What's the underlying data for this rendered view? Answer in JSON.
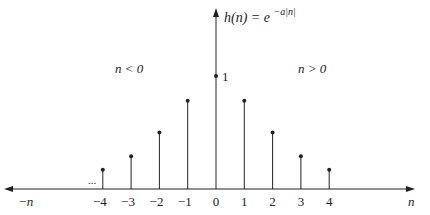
{
  "chart_data": {
    "type": "stem",
    "function_label": "h(n) = e",
    "exponent_label": "−a|n|",
    "xlabel": "n",
    "xlabel_negative": "−n",
    "x": [
      -4,
      -3,
      -2,
      -1,
      0,
      1,
      2,
      3,
      4
    ],
    "tick_labels": [
      "−4",
      "−3",
      "−2",
      "−1",
      "0",
      "1",
      "2",
      "3",
      "4"
    ],
    "values": [
      0.17,
      0.29,
      0.5,
      0.78,
      1.0,
      0.78,
      0.5,
      0.29,
      0.17
    ],
    "y_marker_label": "1",
    "region_left_label": "n < 0",
    "region_right_label": "n > 0",
    "ellipsis": "...",
    "ylim": [
      0,
      1.45
    ]
  },
  "colors": {
    "ink": "#222222",
    "background": "#ffffff"
  }
}
